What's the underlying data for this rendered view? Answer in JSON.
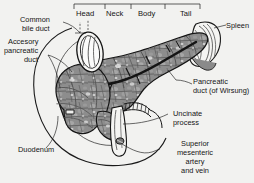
{
  "figure": {
    "background_color": "#f2f2f0",
    "ink_color": "#141414",
    "organ_fill": "#8c8c8c",
    "organ_shadow": "#4a4a4a",
    "duct_color": "#1d1d1d"
  },
  "segment_bracket": {
    "segments": [
      {
        "id": "head",
        "label": "Head"
      },
      {
        "id": "neck",
        "label": "Neck"
      },
      {
        "id": "body",
        "label": "Body"
      },
      {
        "id": "tail",
        "label": "Tail"
      }
    ]
  },
  "labels": {
    "common_bile_duct": {
      "line1": "Common",
      "line2": "bile duct"
    },
    "accessory_pancreatic_duct": {
      "line1": "Accesory",
      "line2": "pancreatic",
      "line3": "duct"
    },
    "duodenum": {
      "line1": "Duodenum"
    },
    "spleen": {
      "line1": "Spleen"
    },
    "pancreatic_duct": {
      "line1": "Pancreatic",
      "line2": "duct (of Wirsung)"
    },
    "uncinate_process": {
      "line1": "Uncinate",
      "line2": "process"
    },
    "superior_mesenteric": {
      "line1": "Superior",
      "line2": "mesenteric",
      "line3": "artery",
      "line4": "and vein"
    }
  }
}
